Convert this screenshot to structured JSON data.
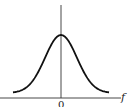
{
  "chart_data": {
    "type": "line",
    "title": "",
    "xlabel": "f",
    "ylabel": "",
    "x_tick_labels": [
      "0"
    ],
    "grid": false,
    "legend": null,
    "series": [
      {
        "name": "gaussian",
        "x": [
          -3,
          -2.5,
          -2,
          -1.5,
          -1,
          -0.5,
          0,
          0.5,
          1,
          1.5,
          2,
          2.5,
          3
        ],
        "values": [
          0.011,
          0.044,
          0.135,
          0.325,
          0.607,
          0.882,
          1.0,
          0.882,
          0.607,
          0.325,
          0.135,
          0.044,
          0.011
        ]
      }
    ],
    "xlim": [
      -3.5,
      3.5
    ],
    "ylim": [
      0,
      1.3
    ]
  },
  "axes": {
    "x_label": "f",
    "origin_label": "0"
  },
  "colors": {
    "curve": "#111111",
    "axis": "#333333"
  }
}
